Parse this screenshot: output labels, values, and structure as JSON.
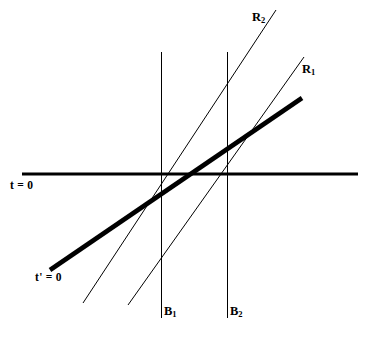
{
  "figure": {
    "kind": "minkowski-spacetime-diagram",
    "background_color": "#ffffff",
    "ink_color": "#000000",
    "width": 369,
    "height": 339
  },
  "labels": {
    "t_axis": "t = 0",
    "t_prime_axis_text": "t' = 0",
    "t_prime_axis_prefix": "t' = 0",
    "b1_base": "B",
    "b1_sub": "1",
    "b2_base": "B",
    "b2_sub": "2",
    "r1_base": "R",
    "r1_sub": "1",
    "r2_base": "R",
    "r2_sub": "2"
  },
  "chart_data": {
    "type": "line",
    "title": "",
    "xlabel": "",
    "ylabel": "",
    "grid": false,
    "legend": "none",
    "axis_ranges": {
      "x": [
        0,
        369
      ],
      "y": [
        0,
        339
      ]
    },
    "note": "Coordinates are in screenshot pixel space; y increases downward.",
    "series": [
      {
        "name": "t = 0",
        "role": "rest-frame simultaneity axis",
        "style": "solid",
        "weight": "thick",
        "color": "#000000",
        "stroke_width": 3.2,
        "points": [
          [
            22,
            174
          ],
          [
            358,
            174
          ]
        ],
        "slope": 0.0,
        "label": "t = 0",
        "label_position": [
          10,
          186
        ]
      },
      {
        "name": "t' = 0",
        "role": "moving-frame simultaneity axis",
        "style": "solid",
        "weight": "very-thick",
        "color": "#000000",
        "stroke_width": 4.6,
        "points": [
          [
            50,
            270
          ],
          [
            302,
            98
          ]
        ],
        "slope": -0.683,
        "label": "t' = 0",
        "label_position": [
          35,
          278
        ]
      },
      {
        "name": "B1",
        "role": "worldline of object B1 (vertical)",
        "style": "solid",
        "weight": "thin",
        "color": "#000000",
        "stroke_width": 1.0,
        "points": [
          [
            161,
            52
          ],
          [
            161,
            318
          ]
        ],
        "slope": null,
        "label": "B1",
        "label_position": [
          164,
          312
        ]
      },
      {
        "name": "B2",
        "role": "worldline of object B2 (vertical)",
        "style": "solid",
        "weight": "thin",
        "color": "#000000",
        "stroke_width": 1.0,
        "points": [
          [
            227,
            52
          ],
          [
            227,
            318
          ]
        ],
        "slope": null,
        "label": "B2",
        "label_position": [
          230,
          312
        ]
      },
      {
        "name": "R1",
        "role": "worldline of moving rod end R1",
        "style": "solid",
        "weight": "thin",
        "color": "#000000",
        "stroke_width": 1.0,
        "points": [
          [
            128,
            305
          ],
          [
            304,
            57
          ]
        ],
        "slope": -1.409,
        "label": "R1",
        "label_position": [
          302,
          70
        ]
      },
      {
        "name": "R2",
        "role": "worldline of moving rod end R2",
        "style": "solid",
        "weight": "thin",
        "color": "#000000",
        "stroke_width": 1.0,
        "points": [
          [
            83,
            303
          ],
          [
            276,
            10
          ]
        ],
        "slope": -1.518,
        "label": "R2",
        "label_position": [
          252,
          18
        ]
      }
    ],
    "intersections": [
      {
        "of": [
          "t = 0",
          "t' = 0"
        ],
        "at": [
          196,
          174
        ]
      },
      {
        "of": [
          "t = 0",
          "B1"
        ],
        "at": [
          161,
          174
        ]
      },
      {
        "of": [
          "t = 0",
          "B2"
        ],
        "at": [
          227,
          174
        ]
      },
      {
        "of": [
          "t = 0",
          "R2"
        ],
        "at": [
          168,
          174
        ]
      },
      {
        "of": [
          "t = 0",
          "R1"
        ],
        "at": [
          221,
          174
        ]
      }
    ]
  }
}
